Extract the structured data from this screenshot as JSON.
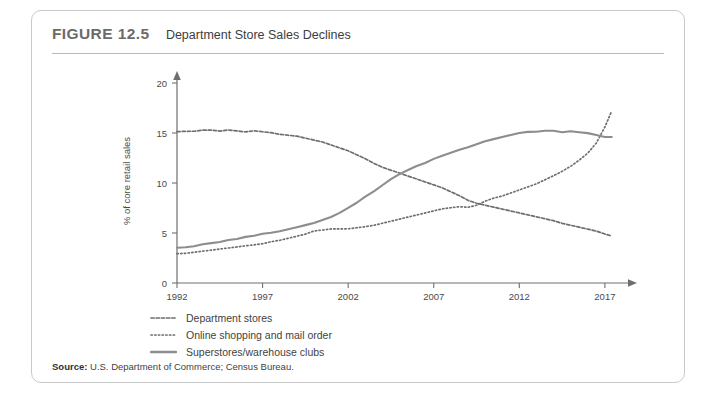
{
  "figure": {
    "number": "FIGURE 12.5",
    "title": "Department Store Sales Declines"
  },
  "source": {
    "label": "Source:",
    "text": "U.S. Department of Commerce; Census Bureau."
  },
  "legend": [
    {
      "label": "Department stores",
      "style": "dashed",
      "color": "#6e6e6e"
    },
    {
      "label": "Online shopping and mail order",
      "style": "dotted",
      "color": "#6e6e6e"
    },
    {
      "label": "Superstores/warehouse clubs",
      "style": "solid",
      "color": "#8d8d8d"
    }
  ],
  "chart_data": {
    "type": "line",
    "title": "Department Store Sales Declines",
    "xlabel": "",
    "ylabel": "% of core retail sales",
    "xlim": [
      1992,
      2018
    ],
    "ylim": [
      0,
      20
    ],
    "xticks": [
      1992,
      1997,
      2002,
      2007,
      2012,
      2017
    ],
    "yticks": [
      0,
      5,
      10,
      15,
      20
    ],
    "grid": false,
    "legend_position": "below",
    "x": [
      1992,
      1992.5,
      1993,
      1993.5,
      1994,
      1994.5,
      1995,
      1995.5,
      1996,
      1996.5,
      1997,
      1997.5,
      1998,
      1998.5,
      1999,
      1999.5,
      2000,
      2000.5,
      2001,
      2001.5,
      2002,
      2002.5,
      2003,
      2003.5,
      2004,
      2004.5,
      2005,
      2005.5,
      2006,
      2006.5,
      2007,
      2007.5,
      2008,
      2008.5,
      2009,
      2009.5,
      2010,
      2010.5,
      2011,
      2011.5,
      2012,
      2012.5,
      2013,
      2013.5,
      2014,
      2014.5,
      2015,
      2015.5,
      2016,
      2016.5,
      2017,
      2017.4
    ],
    "series": [
      {
        "name": "Department stores",
        "style": "dashed",
        "color": "#6e6e6e",
        "values": [
          15.1,
          15.2,
          15.2,
          15.3,
          15.3,
          15.2,
          15.3,
          15.2,
          15.1,
          15.2,
          15.1,
          15.0,
          14.9,
          14.8,
          14.7,
          14.5,
          14.3,
          14.1,
          13.8,
          13.5,
          13.2,
          12.8,
          12.4,
          12.0,
          11.6,
          11.3,
          11.0,
          10.7,
          10.4,
          10.1,
          9.8,
          9.5,
          9.1,
          8.7,
          8.3,
          8.0,
          7.8,
          7.6,
          7.4,
          7.2,
          7.0,
          6.8,
          6.6,
          6.4,
          6.2,
          6.0,
          5.8,
          5.6,
          5.4,
          5.2,
          4.9,
          4.7
        ]
      },
      {
        "name": "Online shopping and mail order",
        "style": "dotted",
        "color": "#6e6e6e",
        "values": [
          2.9,
          3.0,
          3.1,
          3.2,
          3.3,
          3.4,
          3.5,
          3.6,
          3.7,
          3.8,
          3.9,
          4.1,
          4.3,
          4.5,
          4.7,
          4.9,
          5.2,
          5.3,
          5.4,
          5.4,
          5.4,
          5.5,
          5.6,
          5.8,
          6.0,
          6.2,
          6.4,
          6.6,
          6.8,
          7.0,
          7.2,
          7.4,
          7.5,
          7.6,
          7.6,
          7.8,
          8.2,
          8.5,
          8.7,
          9.0,
          9.3,
          9.6,
          9.9,
          10.3,
          10.7,
          11.2,
          11.7,
          12.3,
          13.0,
          14.0,
          15.6,
          17.2
        ]
      },
      {
        "name": "Superstores/warehouse clubs",
        "style": "solid",
        "color": "#8d8d8d",
        "values": [
          3.5,
          3.6,
          3.7,
          3.9,
          4.0,
          4.1,
          4.3,
          4.4,
          4.6,
          4.7,
          4.9,
          5.0,
          5.2,
          5.4,
          5.6,
          5.8,
          6.0,
          6.3,
          6.6,
          7.0,
          7.5,
          8.0,
          8.6,
          9.2,
          9.8,
          10.4,
          10.9,
          11.3,
          11.7,
          12.0,
          12.4,
          12.7,
          13.0,
          13.3,
          13.6,
          13.9,
          14.2,
          14.4,
          14.6,
          14.8,
          15.0,
          15.1,
          15.1,
          15.2,
          15.2,
          15.1,
          15.2,
          15.1,
          15.0,
          14.8,
          14.6,
          14.6
        ]
      }
    ]
  }
}
